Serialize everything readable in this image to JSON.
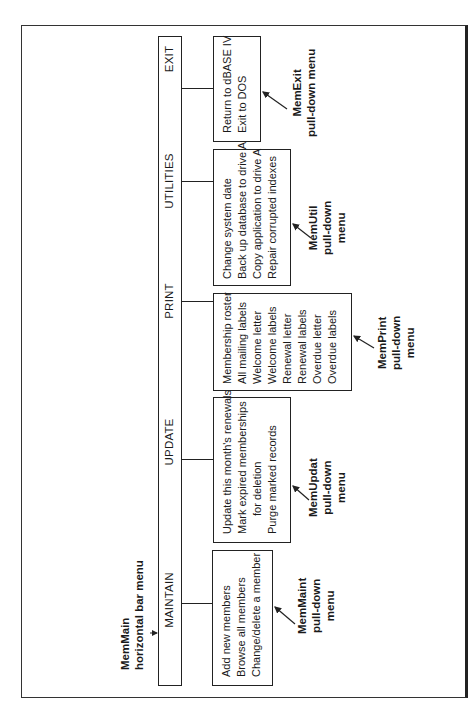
{
  "main_menu": {
    "name_line1": "MemMain",
    "name_line2": "horizontal bar menu",
    "items": [
      {
        "label": "MAINTAIN"
      },
      {
        "label": "UPDATE"
      },
      {
        "label": "PRINT"
      },
      {
        "label": "UTILITIES"
      },
      {
        "label": "EXIT"
      }
    ]
  },
  "pulldowns": {
    "maintain": {
      "name": "MemMaint",
      "caption_line2": "pull-down",
      "caption_line3": "menu",
      "options": [
        "Add new members",
        "Browse all members",
        "Change/delete a member"
      ]
    },
    "update": {
      "name": "MemUpdat",
      "caption_line2": "pull-down",
      "caption_line3": "menu",
      "options": [
        "Update this month's renewals",
        "Mark expired memberships",
        "for deletion",
        "Purge marked records"
      ]
    },
    "print": {
      "name": "MemPrint",
      "caption_line2": "pull-down",
      "caption_line3": "menu",
      "options": [
        "Membership roster",
        "All mailing labels",
        "Welcome letter",
        "Welcome labels",
        "Renewal letter",
        "Renewal labels",
        "Overdue letter",
        "Overdue labels"
      ]
    },
    "utilities": {
      "name": "MemUtil",
      "caption_line2": "pull-down",
      "caption_line3": "menu",
      "options": [
        "Change system date",
        "Back up database to drive A",
        "Copy application to drive A",
        "Repair corrupted indexes"
      ]
    },
    "exit": {
      "name": "MemExit",
      "caption_line2": "pull-down menu",
      "options": [
        "Return to dBASE IV",
        "Exit to DOS"
      ]
    }
  }
}
